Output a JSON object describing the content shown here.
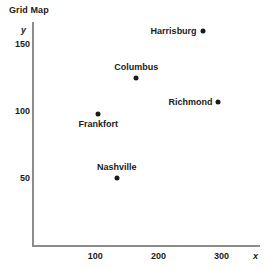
{
  "chart_data": {
    "type": "scatter",
    "title": "Grid Map",
    "xlabel": "x",
    "ylabel": "y",
    "xlim": [
      0,
      330
    ],
    "ylim": [
      0,
      185
    ],
    "grid": false,
    "legend": "none",
    "xticks": [
      100,
      200,
      300
    ],
    "yticks": [
      50,
      100,
      150
    ],
    "xtick_labels": [
      "100",
      "200",
      "300"
    ],
    "ytick_labels": [
      "50",
      "100",
      "150"
    ],
    "points": [
      {
        "label": "Harrisburg",
        "x": 270,
        "y": 160,
        "label_pos": "left"
      },
      {
        "label": "Columbus",
        "x": 165,
        "y": 125,
        "label_pos": "above"
      },
      {
        "label": "Richmond",
        "x": 295,
        "y": 107,
        "label_pos": "left"
      },
      {
        "label": "Frankfort",
        "x": 105,
        "y": 98,
        "label_pos": "below"
      },
      {
        "label": "Nashville",
        "x": 134,
        "y": 50,
        "label_pos": "above"
      }
    ]
  },
  "colors": {
    "point": "#1a1a1a",
    "axis": "#8d8d8d",
    "text": "#1a1a1a",
    "background": "#ffffff"
  }
}
